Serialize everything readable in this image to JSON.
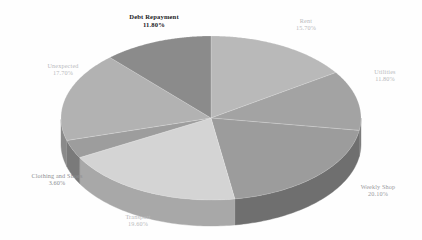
{
  "chart_data": {
    "type": "pie",
    "title": "",
    "subtitle": "",
    "xlabel": "",
    "ylabel": "",
    "legend_position": "none",
    "grid": false,
    "three_d": true,
    "value_suffix": "%",
    "categories": [
      "Rent",
      "Utilities",
      "Weekly Shop",
      "Transport",
      "Clothing and Shoes",
      "Unexpected",
      "Debt Repayment"
    ],
    "values": [
      15.7,
      11.8,
      20.1,
      19.6,
      3.6,
      17.7,
      11.8
    ],
    "slices": [
      {
        "label": "Rent",
        "value": 15.7,
        "value_text": "15.70%",
        "color": "#b9b9b9",
        "side_color": "#8e8e8e",
        "label_style": "faint"
      },
      {
        "label": "Utilities",
        "value": 11.8,
        "value_text": "11.80%",
        "color": "#a3a3a3",
        "side_color": "#7d7d7d",
        "label_style": "faint"
      },
      {
        "label": "Weekly Shop",
        "value": 20.1,
        "value_text": "20.10%",
        "color": "#9c9c9c",
        "side_color": "#6f6f6f",
        "label_style": "mid"
      },
      {
        "label": "Transport",
        "value": 19.6,
        "value_text": "19.60%",
        "color": "#d4d4d4",
        "side_color": "#a8a8a8",
        "label_style": "faint"
      },
      {
        "label": "Clothing and Shoes",
        "value": 3.6,
        "value_text": "3.60%",
        "color": "#9d9d9d",
        "side_color": "#7a7a7a",
        "label_style": "dim"
      },
      {
        "label": "Unexpected",
        "value": 17.7,
        "value_text": "17.70%",
        "color": "#b2b2b2",
        "side_color": "#8a8a8a",
        "label_style": "faint"
      },
      {
        "label": "Debt Repayment",
        "value": 11.8,
        "value_text": "11.80%",
        "color": "#8b8b8b",
        "side_color": "#6a6a6a",
        "label_style": "strong"
      }
    ],
    "background_color": "#fefefe"
  }
}
